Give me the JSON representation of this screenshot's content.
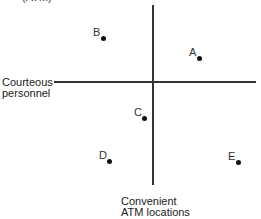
{
  "diagram": {
    "type": "perceptual-map",
    "top_fragment": "(ATM)",
    "axes": {
      "horizontal_label_lines": [
        "Courteous",
        "personnel"
      ],
      "vertical_label_lines": [
        "Convenient",
        "ATM locations"
      ]
    },
    "points": [
      {
        "label": "A",
        "x": 199,
        "y": 58
      },
      {
        "label": "B",
        "x": 103,
        "y": 38
      },
      {
        "label": "C",
        "x": 144,
        "y": 118
      },
      {
        "label": "D",
        "x": 109,
        "y": 161
      },
      {
        "label": "E",
        "x": 238,
        "y": 162
      }
    ]
  }
}
